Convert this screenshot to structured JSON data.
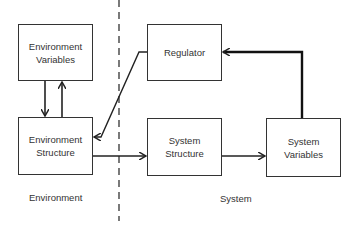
{
  "diagram": {
    "boxes": {
      "env_variables": {
        "line1": "Environment",
        "line2": "Variables"
      },
      "regulator": {
        "line1": "Regulator"
      },
      "env_structure": {
        "line1": "Environment",
        "line2": "Structure"
      },
      "sys_structure": {
        "line1": "System",
        "line2": "Structure"
      },
      "sys_variables": {
        "line1": "System",
        "line2": "Variables"
      }
    },
    "regions": {
      "environment": "Environment",
      "system": "System"
    },
    "edges": [
      {
        "from": "env_variables",
        "to": "env_structure"
      },
      {
        "from": "env_structure",
        "to": "env_variables"
      },
      {
        "from": "regulator",
        "to": "env_structure"
      },
      {
        "from": "env_structure",
        "to": "sys_structure"
      },
      {
        "from": "sys_structure",
        "to": "sys_variables"
      },
      {
        "from": "sys_variables",
        "to": "regulator"
      }
    ]
  }
}
